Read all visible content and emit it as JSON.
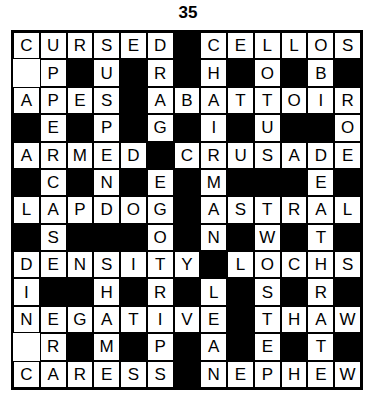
{
  "puzzle": {
    "title": "35",
    "rows": 13,
    "cols": 13,
    "colors": {
      "block": "#000000",
      "cell": "#ffffff",
      "text": "#000000",
      "border": "#000000"
    },
    "grid": [
      [
        "C",
        "U",
        "R",
        "S",
        "E",
        "D",
        "#",
        "C",
        "E",
        "L",
        "L",
        "O",
        "S"
      ],
      [
        "",
        "P",
        "#",
        "U",
        "#",
        "R",
        "#",
        "H",
        "#",
        "O",
        "#",
        "B",
        "#"
      ],
      [
        "A",
        "P",
        "E",
        "S",
        "#",
        "A",
        "B",
        "A",
        "T",
        "T",
        "O",
        "I",
        "R"
      ],
      [
        "#",
        "E",
        "#",
        "P",
        "#",
        "G",
        "#",
        "I",
        "#",
        "U",
        "#",
        "#",
        "O"
      ],
      [
        "A",
        "R",
        "M",
        "E",
        "D",
        "#",
        "C",
        "R",
        "U",
        "S",
        "A",
        "D",
        "E"
      ],
      [
        "#",
        "C",
        "#",
        "N",
        "#",
        "E",
        "#",
        "M",
        "#",
        "#",
        "#",
        "E",
        "#"
      ],
      [
        "L",
        "A",
        "P",
        "D",
        "O",
        "G",
        "#",
        "A",
        "S",
        "T",
        "R",
        "A",
        "L"
      ],
      [
        "#",
        "S",
        "#",
        "#",
        "#",
        "O",
        "#",
        "N",
        "#",
        "W",
        "#",
        "T",
        "#"
      ],
      [
        "D",
        "E",
        "N",
        "S",
        "I",
        "T",
        "Y",
        "#",
        "L",
        "O",
        "C",
        "H",
        "S"
      ],
      [
        "I",
        "#",
        "#",
        "H",
        "#",
        "R",
        "#",
        "L",
        "#",
        "S",
        "#",
        "R",
        "#"
      ],
      [
        "N",
        "E",
        "G",
        "A",
        "T",
        "I",
        "V",
        "E",
        "#",
        "T",
        "H",
        "A",
        "W"
      ],
      [
        "",
        "R",
        "#",
        "M",
        "#",
        "P",
        "#",
        "A",
        "#",
        "E",
        "#",
        "T",
        "#"
      ],
      [
        "C",
        "A",
        "R",
        "E",
        "S",
        "S",
        "#",
        "N",
        "E",
        "P",
        "H",
        "E",
        "W"
      ]
    ]
  }
}
